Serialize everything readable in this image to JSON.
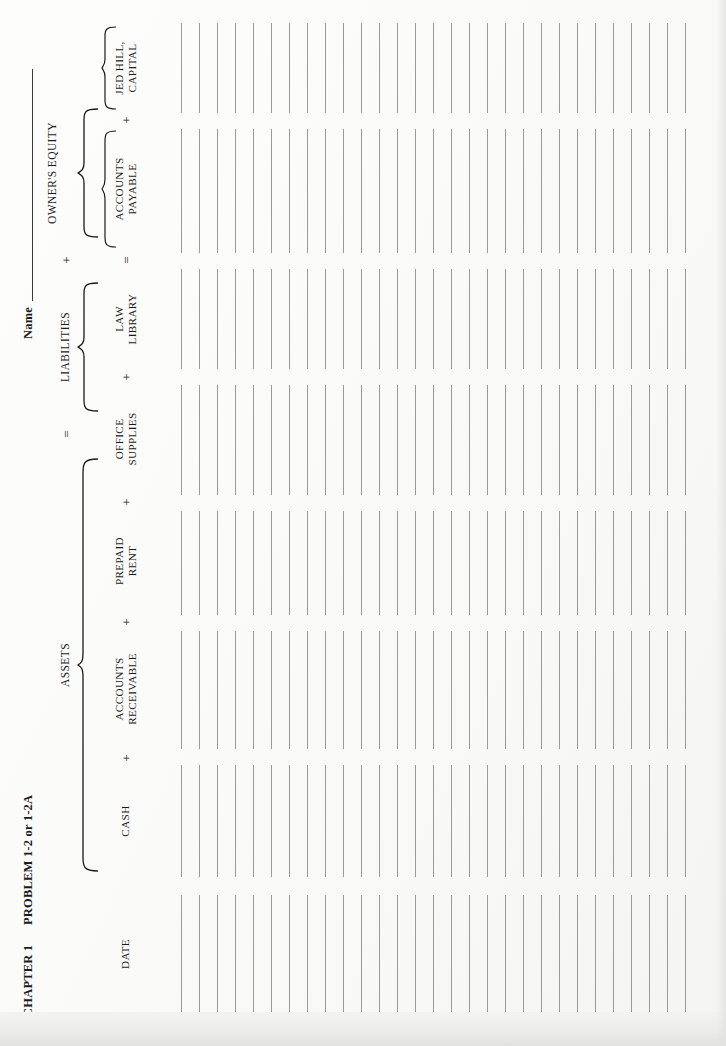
{
  "document": {
    "chapter": "CHAPTER 1",
    "problem": "PROBLEM 1-2 or 1-2A",
    "name_label": "Name",
    "name_value": ""
  },
  "equation": {
    "assets_group": "ASSETS",
    "liabilities_group": "LIABILITIES",
    "owners_equity_group": "OWNER'S EQUITY",
    "op_equals_top": "=",
    "op_plus_top": "+",
    "op_equals_bottom": "=",
    "op_plus_bottom": "+"
  },
  "columns": [
    {
      "id": "date",
      "line1": "DATE",
      "line2": "",
      "operator_before": "",
      "group": ""
    },
    {
      "id": "cash",
      "line1": "CASH",
      "line2": "",
      "operator_before": "",
      "group": "assets"
    },
    {
      "id": "accounts-receivable",
      "line1": "ACCOUNTS",
      "line2": "RECEIVABLE",
      "operator_before": "+",
      "group": "assets"
    },
    {
      "id": "prepaid-rent",
      "line1": "PREPAID",
      "line2": "RENT",
      "operator_before": "+",
      "group": "assets"
    },
    {
      "id": "office-supplies",
      "line1": "OFFICE",
      "line2": "SUPPLIES",
      "operator_before": "+",
      "group": "assets"
    },
    {
      "id": "law-library",
      "line1": "LAW",
      "line2": "LIBRARY",
      "operator_before": "+",
      "group": "assets"
    },
    {
      "id": "accounts-payable",
      "line1": "ACCOUNTS",
      "line2": "PAYABLE",
      "operator_before": "=",
      "group": "liabilities"
    },
    {
      "id": "jed-hill-capital",
      "line1": "JED HILL,",
      "line2": "CAPITAL",
      "operator_before": "+",
      "group": "owners-equity"
    }
  ],
  "ledger": {
    "row_count": 29,
    "row_spacing_px": 18,
    "rule_color": "#9a9a9a",
    "rows": [
      {
        "date": "",
        "cash": "",
        "accounts_receivable": "",
        "prepaid_rent": "",
        "office_supplies": "",
        "law_library": "",
        "accounts_payable": "",
        "jed_hill_capital": ""
      },
      {
        "date": "",
        "cash": "",
        "accounts_receivable": "",
        "prepaid_rent": "",
        "office_supplies": "",
        "law_library": "",
        "accounts_payable": "",
        "jed_hill_capital": ""
      },
      {
        "date": "",
        "cash": "",
        "accounts_receivable": "",
        "prepaid_rent": "",
        "office_supplies": "",
        "law_library": "",
        "accounts_payable": "",
        "jed_hill_capital": ""
      },
      {
        "date": "",
        "cash": "",
        "accounts_receivable": "",
        "prepaid_rent": "",
        "office_supplies": "",
        "law_library": "",
        "accounts_payable": "",
        "jed_hill_capital": ""
      },
      {
        "date": "",
        "cash": "",
        "accounts_receivable": "",
        "prepaid_rent": "",
        "office_supplies": "",
        "law_library": "",
        "accounts_payable": "",
        "jed_hill_capital": ""
      },
      {
        "date": "",
        "cash": "",
        "accounts_receivable": "",
        "prepaid_rent": "",
        "office_supplies": "",
        "law_library": "",
        "accounts_payable": "",
        "jed_hill_capital": ""
      },
      {
        "date": "",
        "cash": "",
        "accounts_receivable": "",
        "prepaid_rent": "",
        "office_supplies": "",
        "law_library": "",
        "accounts_payable": "",
        "jed_hill_capital": ""
      },
      {
        "date": "",
        "cash": "",
        "accounts_receivable": "",
        "prepaid_rent": "",
        "office_supplies": "",
        "law_library": "",
        "accounts_payable": "",
        "jed_hill_capital": ""
      },
      {
        "date": "",
        "cash": "",
        "accounts_receivable": "",
        "prepaid_rent": "",
        "office_supplies": "",
        "law_library": "",
        "accounts_payable": "",
        "jed_hill_capital": ""
      },
      {
        "date": "",
        "cash": "",
        "accounts_receivable": "",
        "prepaid_rent": "",
        "office_supplies": "",
        "law_library": "",
        "accounts_payable": "",
        "jed_hill_capital": ""
      },
      {
        "date": "",
        "cash": "",
        "accounts_receivable": "",
        "prepaid_rent": "",
        "office_supplies": "",
        "law_library": "",
        "accounts_payable": "",
        "jed_hill_capital": ""
      },
      {
        "date": "",
        "cash": "",
        "accounts_receivable": "",
        "prepaid_rent": "",
        "office_supplies": "",
        "law_library": "",
        "accounts_payable": "",
        "jed_hill_capital": ""
      },
      {
        "date": "",
        "cash": "",
        "accounts_receivable": "",
        "prepaid_rent": "",
        "office_supplies": "",
        "law_library": "",
        "accounts_payable": "",
        "jed_hill_capital": ""
      },
      {
        "date": "",
        "cash": "",
        "accounts_receivable": "",
        "prepaid_rent": "",
        "office_supplies": "",
        "law_library": "",
        "accounts_payable": "",
        "jed_hill_capital": ""
      },
      {
        "date": "",
        "cash": "",
        "accounts_receivable": "",
        "prepaid_rent": "",
        "office_supplies": "",
        "law_library": "",
        "accounts_payable": "",
        "jed_hill_capital": ""
      },
      {
        "date": "",
        "cash": "",
        "accounts_receivable": "",
        "prepaid_rent": "",
        "office_supplies": "",
        "law_library": "",
        "accounts_payable": "",
        "jed_hill_capital": ""
      },
      {
        "date": "",
        "cash": "",
        "accounts_receivable": "",
        "prepaid_rent": "",
        "office_supplies": "",
        "law_library": "",
        "accounts_payable": "",
        "jed_hill_capital": ""
      },
      {
        "date": "",
        "cash": "",
        "accounts_receivable": "",
        "prepaid_rent": "",
        "office_supplies": "",
        "law_library": "",
        "accounts_payable": "",
        "jed_hill_capital": ""
      },
      {
        "date": "",
        "cash": "",
        "accounts_receivable": "",
        "prepaid_rent": "",
        "office_supplies": "",
        "law_library": "",
        "accounts_payable": "",
        "jed_hill_capital": ""
      },
      {
        "date": "",
        "cash": "",
        "accounts_receivable": "",
        "prepaid_rent": "",
        "office_supplies": "",
        "law_library": "",
        "accounts_payable": "",
        "jed_hill_capital": ""
      },
      {
        "date": "",
        "cash": "",
        "accounts_receivable": "",
        "prepaid_rent": "",
        "office_supplies": "",
        "law_library": "",
        "accounts_payable": "",
        "jed_hill_capital": ""
      },
      {
        "date": "",
        "cash": "",
        "accounts_receivable": "",
        "prepaid_rent": "",
        "office_supplies": "",
        "law_library": "",
        "accounts_payable": "",
        "jed_hill_capital": ""
      },
      {
        "date": "",
        "cash": "",
        "accounts_receivable": "",
        "prepaid_rent": "",
        "office_supplies": "",
        "law_library": "",
        "accounts_payable": "",
        "jed_hill_capital": ""
      },
      {
        "date": "",
        "cash": "",
        "accounts_receivable": "",
        "prepaid_rent": "",
        "office_supplies": "",
        "law_library": "",
        "accounts_payable": "",
        "jed_hill_capital": ""
      },
      {
        "date": "",
        "cash": "",
        "accounts_receivable": "",
        "prepaid_rent": "",
        "office_supplies": "",
        "law_library": "",
        "accounts_payable": "",
        "jed_hill_capital": ""
      },
      {
        "date": "",
        "cash": "",
        "accounts_receivable": "",
        "prepaid_rent": "",
        "office_supplies": "",
        "law_library": "",
        "accounts_payable": "",
        "jed_hill_capital": ""
      },
      {
        "date": "",
        "cash": "",
        "accounts_receivable": "",
        "prepaid_rent": "",
        "office_supplies": "",
        "law_library": "",
        "accounts_payable": "",
        "jed_hill_capital": ""
      },
      {
        "date": "",
        "cash": "",
        "accounts_receivable": "",
        "prepaid_rent": "",
        "office_supplies": "",
        "law_library": "",
        "accounts_payable": "",
        "jed_hill_capital": ""
      },
      {
        "date": "",
        "cash": "",
        "accounts_receivable": "",
        "prepaid_rent": "",
        "office_supplies": "",
        "law_library": "",
        "accounts_payable": "",
        "jed_hill_capital": ""
      }
    ]
  },
  "colors": {
    "paper": "#fbfbfa",
    "ink": "#1a1a1a",
    "rule": "#9a9a9a",
    "column_separator": "#c9c9c8"
  }
}
